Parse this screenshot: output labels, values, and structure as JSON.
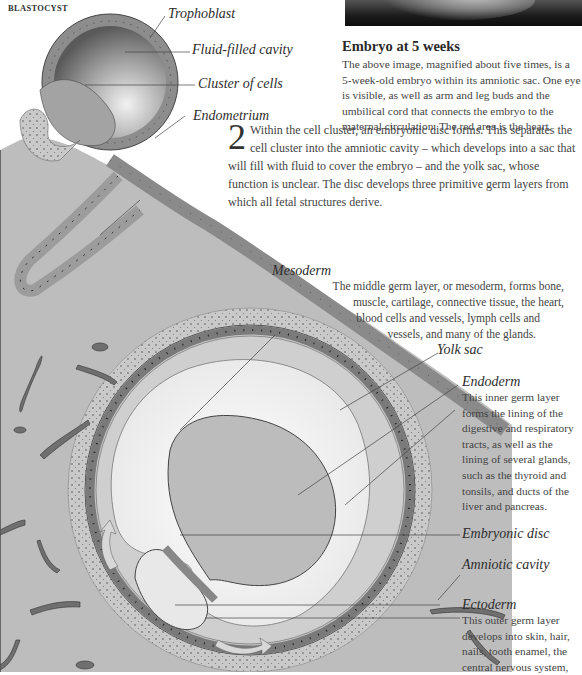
{
  "section_label": "BLASTOCYST",
  "photo": {
    "alt": "embryo-photo"
  },
  "caption": {
    "title": "Embryo at 5 weeks",
    "text": "The above image, magnified about five times, is a 5-week-old embryo within its amniotic sac. One eye is visible, as well as arm and leg buds and the umbilical cord that connects the embryo to the maternal circulation. The red area is the heart."
  },
  "step": {
    "number": "2",
    "text": "Within the cell cluster, an embryonic disc forms. This separates the cell cluster into the amniotic cavity – which develops into a sac that will fill with fluid to cover the embryo – and the yolk sac, whose function is unclear. The disc develops three primitive germ layers from which all fetal structures derive."
  },
  "labels": {
    "trophoblast": "Trophoblast",
    "fluid_cavity": "Fluid-filled cavity",
    "cluster": "Cluster of cells",
    "endometrium": "Endometrium",
    "mesoderm": "Mesoderm",
    "yolk_sac": "Yolk sac",
    "endoderm": "Endoderm",
    "embryonic_disc": "Embryonic disc",
    "amniotic_cavity": "Amniotic cavity",
    "ectoderm": "Ectoderm"
  },
  "descriptions": {
    "mesoderm": [
      "The middle germ layer, or mesoderm, forms bone,",
      "muscle, cartilage, connective tissue, the heart,",
      "blood cells and vessels, lymph cells and",
      "vessels, and many of the glands."
    ],
    "endoderm": [
      "This inner germ layer",
      "forms the lining of the",
      "digestive and respiratory",
      "tracts, as well as the",
      "lining of several glands,",
      "such as the thyroid and",
      "tonsils, and ducts of the",
      "liver and pancreas."
    ],
    "ectoderm": [
      "This outer germ layer",
      "develops into skin, hair,",
      "nails, tooth enamel, the",
      "central nervous system,"
    ]
  }
}
